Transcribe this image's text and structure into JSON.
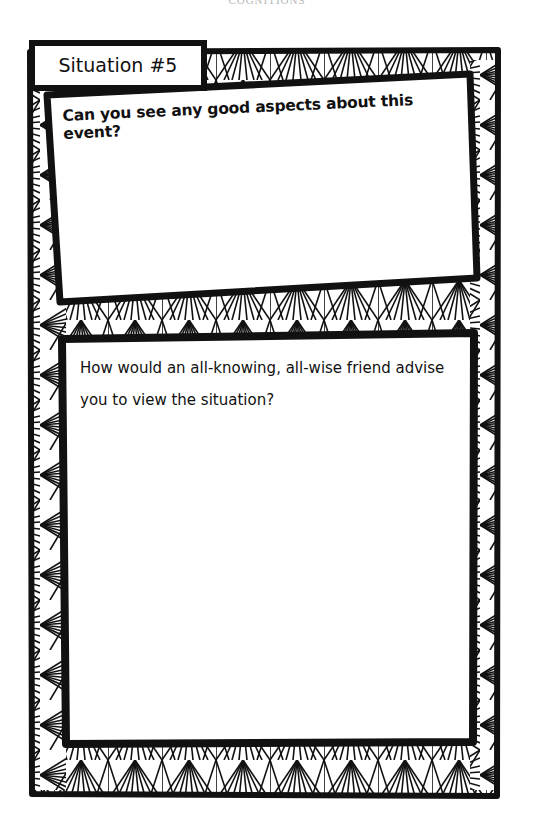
{
  "page": {
    "running_head": "COGNITIONS"
  },
  "worksheet": {
    "tab_title": "Situation #5",
    "sections": [
      {
        "prompt": "Can you see any good aspects about this event?",
        "answer": ""
      },
      {
        "prompt": "How would an all-knowing, all-wise friend advise you to view the situation?",
        "answer": ""
      }
    ],
    "colors": {
      "ink": "#111111",
      "paper": "#ffffff",
      "running_head": "#b8b8b8"
    },
    "border_pattern": "hand-drawn-fan-triangle-doodle"
  }
}
